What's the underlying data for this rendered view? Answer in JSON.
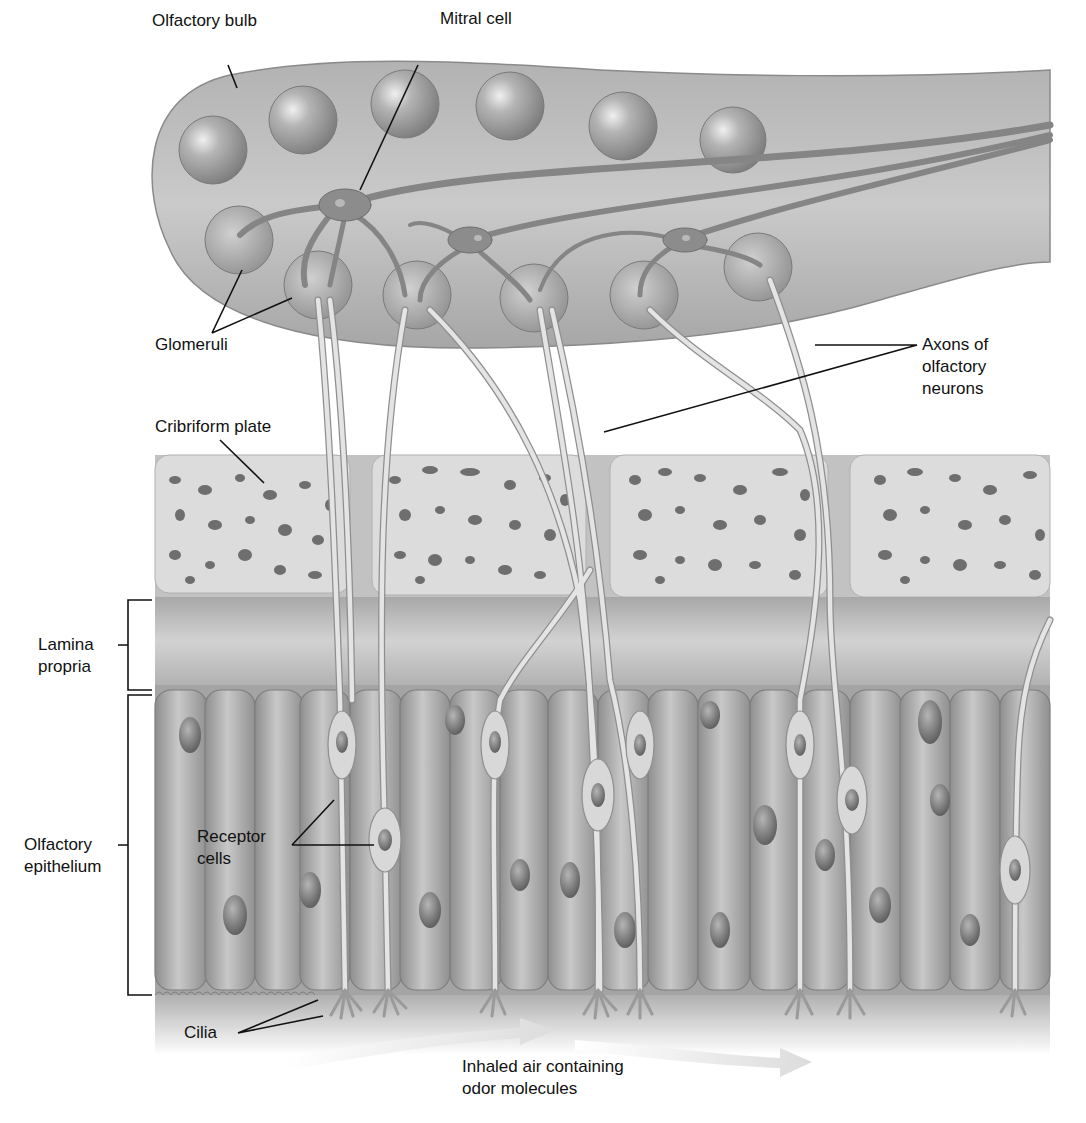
{
  "figure": {
    "colors": {
      "background": "#ffffff",
      "bulb_fill": "#b9b9b9",
      "bulb_edge": "#8a8a8a",
      "sphere_fill": "#9e9e9e",
      "neuron_fill": "#8c8c8c",
      "axon_fill": "#e4e4e4",
      "axon_edge": "#8f8f8f",
      "plate_fill": "#dcdcdc",
      "plate_pore": "#6e6e6e",
      "lamina_fill": "#bdbdbd",
      "epithelium_fill": "#a9a9a9",
      "nucleus_fill": "#6f6f6f",
      "air_arrow": "#e6e6e6",
      "leader_line": "#111111"
    }
  },
  "labels": {
    "olfactory_bulb": "Olfactory bulb",
    "mitral_cell": "Mitral cell",
    "glomeruli": "Glomeruli",
    "axons_line1": "Axons of",
    "axons_line2": "olfactory",
    "axons_line3": "neurons",
    "cribriform_plate": "Cribriform plate",
    "lamina_line1": "Lamina",
    "lamina_line2": "propria",
    "epithelium_line1": "Olfactory",
    "epithelium_line2": "epithelium",
    "receptor_line1": "Receptor",
    "receptor_line2": "cells",
    "cilia": "Cilia",
    "air_line1": "Inhaled air containing",
    "air_line2": "odor molecules"
  },
  "structures": {
    "glomeruli_top_row_count": 6,
    "glomeruli_bottom_row_count": 6,
    "mitral_cell_count": 3,
    "cribriform_plate_segments": 4,
    "layers": [
      "Olfactory bulb",
      "Cribriform plate",
      "Lamina propria",
      "Olfactory epithelium"
    ]
  }
}
